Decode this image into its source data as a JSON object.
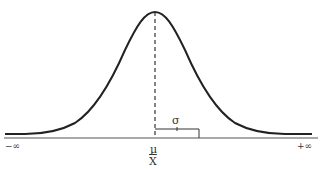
{
  "diagram": {
    "type": "normal-distribution-curve",
    "labels": {
      "left_limit": "−∞",
      "right_limit": "+∞",
      "mean_symbol": "μ",
      "sample_mean_symbol": "X",
      "std_dev_symbol": "σ"
    },
    "colors": {
      "curve": "#222222",
      "axis": "#444444",
      "text": "#333333"
    }
  }
}
